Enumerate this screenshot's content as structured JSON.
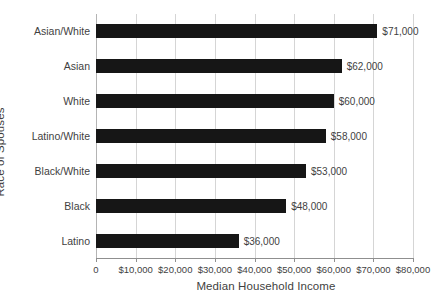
{
  "chart_data": {
    "type": "bar",
    "orientation": "horizontal",
    "title": "",
    "xlabel": "Median Household Income",
    "ylabel": "Race of Spouses",
    "categories": [
      "Asian/White",
      "Asian",
      "White",
      "Latino/White",
      "Black/White",
      "Black",
      "Latino"
    ],
    "values": [
      71000,
      62000,
      60000,
      58000,
      53000,
      48000,
      36000
    ],
    "value_labels": [
      "$71,000",
      "$62,000",
      "$60,000",
      "$58,000",
      "$53,000",
      "$48,000",
      "$36,000"
    ],
    "xlim": [
      0,
      80000
    ],
    "xticks": [
      0,
      10000,
      20000,
      30000,
      40000,
      50000,
      60000,
      70000,
      80000
    ],
    "xtick_labels": [
      "0",
      "$10,000",
      "$20,000",
      "$30,000",
      "$40,000",
      "$50,000",
      "$60,000",
      "$70,000",
      "$80,000"
    ],
    "grid": "vertical",
    "legend": "none",
    "bar_color": "#161616",
    "gridline_color": "#d5d5d5",
    "axis_color": "#8f8f8f",
    "text_color": "#3f3f3f",
    "background_color": "#ffffff"
  }
}
